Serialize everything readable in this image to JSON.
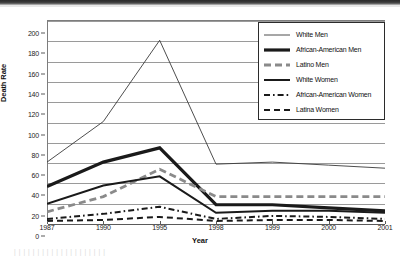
{
  "chart_data": {
    "type": "line",
    "title": "",
    "xlabel": "Year",
    "ylabel": "Death Rate",
    "categories": [
      "1987",
      "1990",
      "1995",
      "1998",
      "1999",
      "2000",
      "2001"
    ],
    "ylim": [
      0,
      200
    ],
    "ytick_step": 20,
    "yticks": [
      "200",
      "180",
      "160",
      "140",
      "120",
      "100",
      "80",
      "60",
      "40",
      "20",
      "0"
    ],
    "grid": "horizontal",
    "legend_position": "top-right",
    "series": [
      {
        "name": "White Men",
        "style": "thin-solid",
        "color": "#3a3a3a",
        "values": [
          60,
          100,
          180,
          58,
          60,
          57,
          54
        ]
      },
      {
        "name": "African-American Men",
        "style": "thick-solid",
        "color": "#1a1a1a",
        "values": [
          36,
          60,
          74,
          18,
          18,
          15,
          12
        ]
      },
      {
        "name": "Latino Men",
        "style": "thick-dashed",
        "color": "#8a8a8a",
        "values": [
          11,
          26,
          53,
          26,
          26,
          26,
          26
        ]
      },
      {
        "name": "White Women",
        "style": "medium-solid",
        "color": "#1a1a1a",
        "values": [
          19,
          37,
          46,
          10,
          12,
          12,
          10
        ]
      },
      {
        "name": "African-American Women",
        "style": "dash-dot",
        "color": "#1a1a1a",
        "values": [
          4,
          9,
          16,
          4,
          7,
          6,
          4
        ]
      },
      {
        "name": "Latina Women",
        "style": "dashed",
        "color": "#1a1a1a",
        "values": [
          2,
          3,
          6,
          2,
          3,
          3,
          2
        ]
      }
    ]
  },
  "legend": {
    "items": [
      {
        "label": "White Men"
      },
      {
        "label": "African-American Men"
      },
      {
        "label": "Latino Men"
      },
      {
        "label": "White Women"
      },
      {
        "label": "African-American Women"
      },
      {
        "label": "Latina Women"
      }
    ]
  },
  "scan_artifact": {
    "ghost_text": "|  |  |  |  |  |  |  |  |  |  |  |  |  |  |  |  |  |  |  |"
  }
}
